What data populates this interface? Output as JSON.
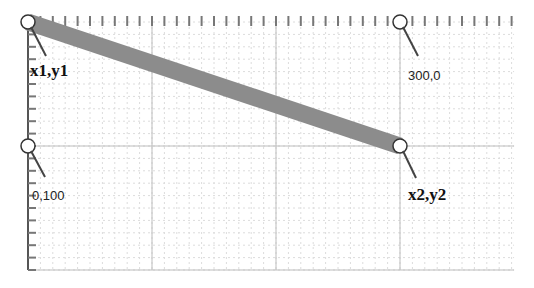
{
  "diagram": {
    "type": "coordinate-line-illustration",
    "origin_px": [
      28,
      22
    ],
    "scale_px_per_unit": 1.24,
    "grid": {
      "minor_step_units": 10,
      "major_step_units": 100,
      "width_units": 392,
      "height_units": 200
    },
    "line": {
      "x1": 0,
      "y1": 0,
      "x2": 300,
      "y2": 100,
      "stroke_width": 17,
      "color": "#8c8c8c"
    },
    "labels": {
      "start": "x1,y1",
      "end": "x2,y2",
      "x_marker": "300,0",
      "y_marker": "0,100"
    },
    "colors": {
      "grid_minor": "#dcdcdc",
      "grid_major": "#bdbdbd",
      "axis": "#555555",
      "line": "#8c8c8c",
      "handle_fill": "#ffffff",
      "handle_stroke": "#333333"
    }
  }
}
